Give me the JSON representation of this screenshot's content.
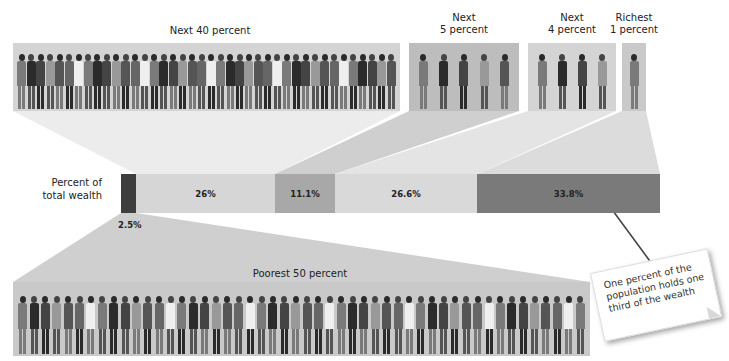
{
  "groups": {
    "next40": {
      "label": "Next 40 percent"
    },
    "next5": {
      "label_line1": "Next",
      "label_line2": "5 percent"
    },
    "next4": {
      "label_line1": "Next",
      "label_line2": "4 percent"
    },
    "richest1": {
      "label_line1": "Richest",
      "label_line2": "1 percent"
    },
    "poorest50": {
      "label": "Poorest 50 percent"
    }
  },
  "bar": {
    "axis_label_line1": "Percent of",
    "axis_label_line2": "total wealth",
    "segments": [
      {
        "group": "Poorest 50 percent",
        "label": "2.5%",
        "value": 2.5,
        "color": "#3e3e3e"
      },
      {
        "group": "Next 40 percent",
        "label": "26%",
        "value": 26,
        "color": "#d6d6d6"
      },
      {
        "group": "Next 5 percent",
        "label": "11.1%",
        "value": 11.1,
        "color": "#a8a8a8"
      },
      {
        "group": "Next 4 percent",
        "label": "26.6%",
        "value": 26.6,
        "color": "#d9d9d9"
      },
      {
        "group": "Richest 1 percent",
        "label": "33.8%",
        "value": 33.8,
        "color": "#7a7a7a"
      }
    ]
  },
  "callout": {
    "text": "One percent of the population holds one third of the wealth"
  },
  "chart_data": {
    "type": "bar",
    "orientation": "horizontal-stacked",
    "title": "",
    "xlabel": "",
    "ylabel": "Percent of total wealth",
    "categories": [
      "Poorest 50 percent",
      "Next 40 percent",
      "Next 5 percent",
      "Next 4 percent",
      "Richest 1 percent"
    ],
    "values": [
      2.5,
      26,
      11.1,
      26.6,
      33.8
    ],
    "value_labels": [
      "2.5%",
      "26%",
      "11.1%",
      "26.6%",
      "33.8%"
    ],
    "population_share_percent": [
      50,
      40,
      5,
      4,
      1
    ],
    "annotations": [
      "One percent of the population holds one third of the wealth"
    ],
    "grid": false,
    "legend": "none"
  }
}
